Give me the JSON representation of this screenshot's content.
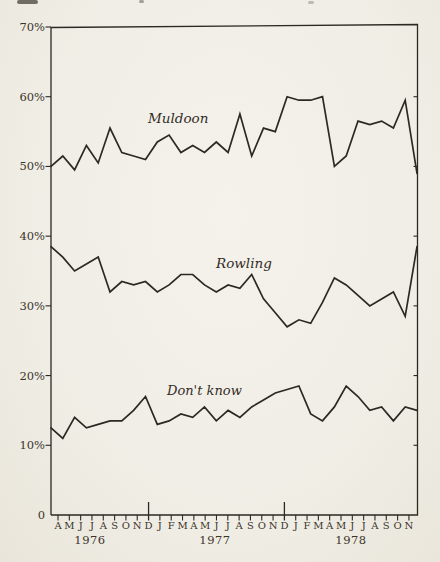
{
  "page": {
    "paper_color": "#f0ede5",
    "ink_color": "#2c2822"
  },
  "chart_data": {
    "type": "line",
    "title": "",
    "xlabel": "",
    "ylabel": "",
    "grid": false,
    "legend": "inline-labels",
    "ylim": [
      0,
      70
    ],
    "yticks": [
      "0",
      "10%",
      "20%",
      "30%",
      "40%",
      "50%",
      "60%",
      "70%"
    ],
    "months": [
      "A",
      "M",
      "J",
      "J",
      "A",
      "S",
      "O",
      "N",
      "D",
      "J",
      "F",
      "M",
      "A",
      "M",
      "J",
      "J",
      "A",
      "S",
      "O",
      "N",
      "D",
      "J",
      "F",
      "M",
      "A",
      "M",
      "J",
      "J",
      "A",
      "S",
      "O",
      "N"
    ],
    "years": [
      {
        "label": "1976",
        "start": 0,
        "end": 8
      },
      {
        "label": "1977",
        "start": 9,
        "end": 20
      },
      {
        "label": "1978",
        "start": 21,
        "end": 31
      }
    ],
    "x_range_note": "monthly points, Apr 1976 - Nov 1978",
    "series": [
      {
        "name": "Muldoon",
        "values": [
          50,
          51.5,
          49.5,
          53,
          50.5,
          55.5,
          52,
          51.5,
          51,
          53.5,
          54.5,
          52,
          53,
          52,
          53.5,
          52,
          57.5,
          51.5,
          55.5,
          55,
          60,
          59.5,
          59.5,
          60,
          50,
          51.5,
          56.5,
          56,
          56.5,
          55.5,
          59.5,
          49
        ]
      },
      {
        "name": "Rowling",
        "values": [
          38.5,
          37,
          35,
          36,
          37,
          32,
          33.5,
          33,
          33.5,
          32,
          33,
          34.5,
          34.5,
          33,
          32,
          33,
          32.5,
          34.5,
          31,
          29,
          27,
          28,
          27.5,
          30.5,
          34,
          33,
          31.5,
          30,
          31,
          32,
          28.5,
          38.5
        ]
      },
      {
        "name": "Don't know",
        "values": [
          12.5,
          11,
          14,
          12.5,
          13,
          13.5,
          13.5,
          15,
          17,
          13,
          13.5,
          14.5,
          14,
          15.5,
          13.5,
          15,
          14,
          15.5,
          16.5,
          17.5,
          18,
          18.5,
          14.5,
          13.5,
          15.5,
          18.5,
          17,
          15,
          15.5,
          13.5,
          15.5,
          15
        ]
      }
    ]
  }
}
